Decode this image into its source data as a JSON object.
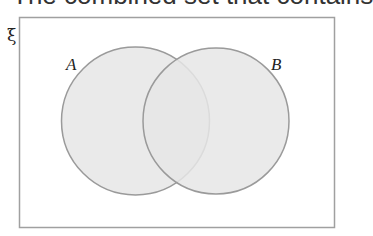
{
  "title_partial": "The combined set that contains",
  "diagram": {
    "type": "venn",
    "universal_set_symbol": "ξ",
    "sets": [
      {
        "label": "A",
        "cx": 135.5,
        "cy": 121,
        "r": 74
      },
      {
        "label": "B",
        "cx": 216,
        "cy": 121,
        "r": 73
      }
    ],
    "colors": {
      "fill": "#e6e6e6",
      "stroke": "#9a9a9a",
      "frame": "#a0a0a0"
    }
  }
}
